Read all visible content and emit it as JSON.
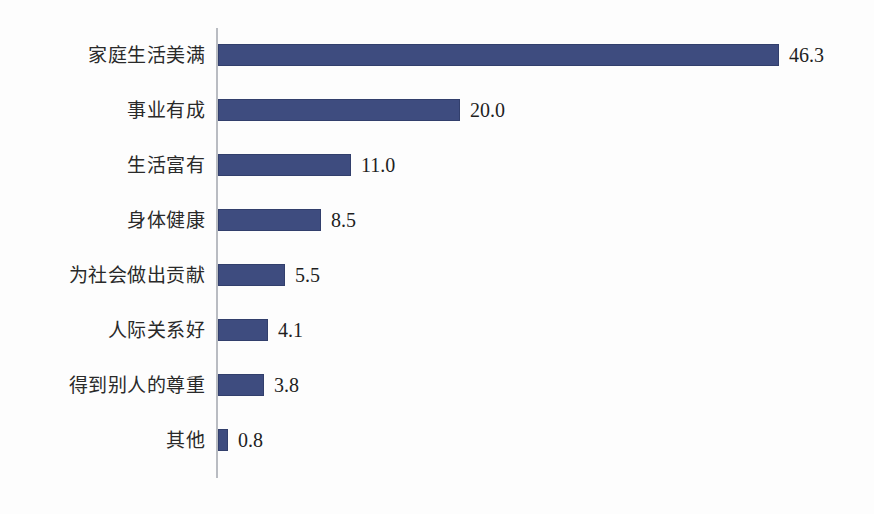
{
  "chart_data": {
    "type": "bar",
    "orientation": "horizontal",
    "title": "",
    "subtitle": "",
    "xlabel": "",
    "ylabel": "",
    "xlim": [
      0,
      50
    ],
    "grid": false,
    "legend": false,
    "legend_position": "none",
    "value_labels_shown": true,
    "categories": [
      "家庭生活美满",
      "事业有成",
      "生活富有",
      "身体健康",
      "为社会做出贡献",
      "人际关系好",
      "得到别人的尊重",
      "其他"
    ],
    "values": [
      46.3,
      20.0,
      11.0,
      8.5,
      5.5,
      4.1,
      3.8,
      0.8
    ],
    "value_label_texts": [
      "46.3",
      "20.0",
      "11.0",
      "8.5",
      "5.5",
      "4.1",
      "3.8",
      "0.8"
    ],
    "series": [
      {
        "name": "",
        "values": [
          46.3,
          20.0,
          11.0,
          8.5,
          5.5,
          4.1,
          3.8,
          0.8
        ]
      }
    ]
  },
  "style": {
    "bar_color": "#3e4c7f",
    "axis_color": "#b9bcc2",
    "label_color": "#2a2a2a",
    "value_color": "#1f1f1f",
    "background": "#fdfdfd"
  },
  "layout": {
    "axis_x": 216,
    "bar_start_x": 218,
    "px_per_unit": 12.12,
    "first_row_top": 44,
    "row_pitch": 55,
    "bar_height": 22,
    "value_gap": 10
  }
}
